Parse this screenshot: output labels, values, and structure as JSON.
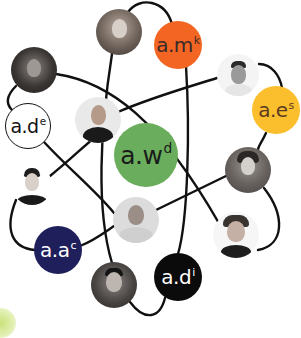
{
  "diagram": {
    "type": "network-of-people",
    "colors": {
      "line": "#111111",
      "orange": "#f26522",
      "yellow": "#fbbf2e",
      "green": "#6aad5c",
      "navy": "#1f1f5c",
      "black": "#0b0b0b",
      "white": "#ffffff",
      "accent_corner": "#c9e27a"
    },
    "label_nodes": [
      {
        "id": "amk",
        "base": "a.m",
        "sup": "k",
        "fill": "#f26522",
        "text_color": "#3a2a2a",
        "cx": 178,
        "cy": 45,
        "r": 24,
        "font": 20
      },
      {
        "id": "aes",
        "base": "a.e",
        "sup": "s",
        "fill": "#fbbf2e",
        "text_color": "#5a3a20",
        "cx": 276,
        "cy": 110,
        "r": 24,
        "font": 20
      },
      {
        "id": "ade",
        "base": "a.d",
        "sup": "e",
        "fill": "#ffffff",
        "text_color": "#111111",
        "border": "#111111",
        "cx": 28,
        "cy": 126,
        "r": 23,
        "font": 19
      },
      {
        "id": "awd",
        "base": "a.w",
        "sup": "d",
        "fill": "#6aad5c",
        "text_color": "#1a1a1a",
        "cx": 146,
        "cy": 155,
        "r": 32,
        "font": 25
      },
      {
        "id": "aac",
        "base": "a.a",
        "sup": "c",
        "fill": "#1f1f5c",
        "text_color": "#ffffff",
        "cx": 58,
        "cy": 250,
        "r": 24,
        "font": 20
      },
      {
        "id": "adi",
        "base": "a.d",
        "sup": "i",
        "fill": "#0b0b0b",
        "text_color": "#ffffff",
        "cx": 178,
        "cy": 277,
        "r": 24,
        "font": 20
      }
    ],
    "photo_nodes": [
      {
        "id": "p_top_woman",
        "cx": 119,
        "cy": 32,
        "r": 23
      },
      {
        "id": "p_topleft_woman",
        "cx": 34,
        "cy": 70,
        "r": 23
      },
      {
        "id": "p_topright_man",
        "cx": 238,
        "cy": 75,
        "r": 21
      },
      {
        "id": "p_bald_man",
        "cx": 98,
        "cy": 120,
        "r": 23
      },
      {
        "id": "p_right_woman",
        "cx": 248,
        "cy": 170,
        "r": 23
      },
      {
        "id": "p_left_young_man",
        "cx": 32,
        "cy": 185,
        "r": 20
      },
      {
        "id": "p_center_older_man",
        "cx": 136,
        "cy": 220,
        "r": 23
      },
      {
        "id": "p_right_smiling_man",
        "cx": 236,
        "cy": 235,
        "r": 23
      },
      {
        "id": "p_bottom_man",
        "cx": 114,
        "cy": 285,
        "r": 23
      }
    ]
  }
}
